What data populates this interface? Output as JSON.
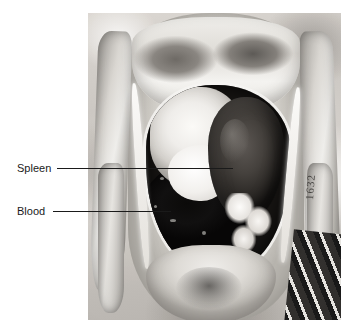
{
  "figure": {
    "name": "annotated-anatomical-photograph",
    "kind": "autopsy-photograph",
    "background_color": "#ffffff"
  },
  "photo": {
    "name": "abdominal-cavity-photo",
    "description": "Black and white autopsy photograph of an opened abdominal cavity",
    "marking_text": "1632",
    "left": 88,
    "top": 13,
    "width": 253,
    "height": 307
  },
  "annotations": [
    {
      "id": "spleen",
      "label": "Spleen",
      "label_left": 17,
      "label_top": 162,
      "line_left": 57,
      "line_top": 168,
      "line_width": 176,
      "color": "#1a1a1a"
    },
    {
      "id": "blood",
      "label": "Blood",
      "label_left": 17,
      "label_top": 205,
      "line_left": 53,
      "line_top": 211,
      "line_width": 118,
      "color": "#1a1a1a"
    }
  ]
}
